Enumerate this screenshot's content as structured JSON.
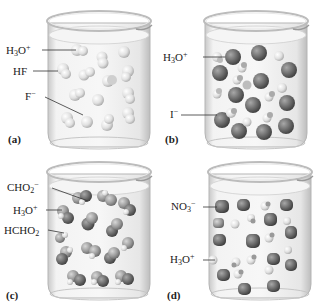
{
  "figure": {
    "colors": {
      "light_sphere": "#e4e4e4",
      "dark_sphere": "#6e6e6e",
      "medium_sphere": "#9a9a9a",
      "beaker_glass": "#d9d9d9",
      "liquid": "#eeeeee",
      "leader_line": "#333333"
    },
    "panels": [
      {
        "id": "a",
        "caption": "(a)",
        "labels": [
          {
            "base": "H",
            "sub1": "3",
            "mid": "O",
            "sup": "+",
            "text": "H3O+"
          },
          {
            "text": "HF"
          },
          {
            "base": "F",
            "sup": "−",
            "text": "F−"
          }
        ]
      },
      {
        "id": "b",
        "caption": "(b)",
        "labels": [
          {
            "base": "H",
            "sub1": "3",
            "mid": "O",
            "sup": "+",
            "text": "H3O+"
          },
          {
            "base": "I",
            "sup": "−",
            "text": "I−"
          }
        ]
      },
      {
        "id": "c",
        "caption": "(c)",
        "labels": [
          {
            "base": "CHO",
            "sub1": "2",
            "sup": "−",
            "text": "CHO2−"
          },
          {
            "base": "H",
            "sub1": "3",
            "mid": "O",
            "sup": "+",
            "text": "H3O+"
          },
          {
            "base": "HCHO",
            "sub1": "2",
            "text": "HCHO2"
          }
        ]
      },
      {
        "id": "d",
        "caption": "(d)",
        "labels": [
          {
            "base": "NO",
            "sub1": "3",
            "sup": "−",
            "text": "NO3−"
          },
          {
            "base": "H",
            "sub1": "3",
            "mid": "O",
            "sup": "+",
            "text": "H3O+"
          }
        ]
      }
    ]
  }
}
